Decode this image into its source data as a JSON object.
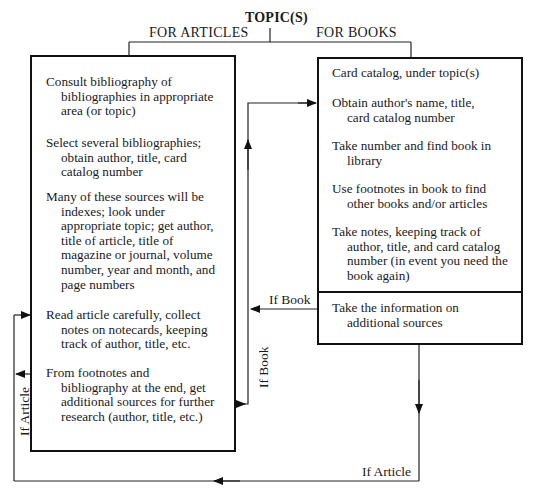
{
  "title": "TOPIC(S)",
  "branches": {
    "articles": "FOR ARTICLES",
    "books": "FOR BOOKS"
  },
  "articles_box": {
    "items": [
      {
        "first": "Consult bibliography of",
        "rest": [
          "bibliographies in appropriate",
          "area (or topic)"
        ]
      },
      {
        "first": "Select several bibliographies;",
        "rest": [
          "obtain author, title, card",
          "catalog number"
        ]
      },
      {
        "first": "Many of these sources will be",
        "rest": [
          "indexes; look under",
          "appropriate topic; get author,",
          "title of article, title of",
          "magazine or journal, volume",
          "number, year and month, and",
          "page numbers"
        ]
      },
      {
        "first": "Read article carefully, collect",
        "rest": [
          "notes on notecards, keeping",
          "track of author, title, etc."
        ]
      },
      {
        "first": "From footnotes and",
        "rest": [
          "bibliography at the end, get",
          "additional sources for further",
          "research (author, title, etc.)"
        ]
      }
    ]
  },
  "books_box": {
    "items": [
      {
        "first": "Card catalog, under topic(s)",
        "rest": []
      },
      {
        "first": "Obtain author's name, title,",
        "rest": [
          "card catalog number"
        ]
      },
      {
        "first": "Take number and find book in",
        "rest": [
          "library"
        ]
      },
      {
        "first": "Use footnotes in book to find",
        "rest": [
          "other books and/or articles"
        ]
      },
      {
        "first": "Take notes, keeping track of",
        "rest": [
          "author, title, and card catalog",
          "number (in event you need the",
          "book again)"
        ]
      }
    ],
    "bottom_section": {
      "first": "Take the information on",
      "rest": [
        "additional sources"
      ]
    }
  },
  "connector_labels": {
    "if_book_horizontal": "If Book",
    "if_book_vertical": "If Book",
    "if_article_vertical": "If Article",
    "if_article_bottom": "If Article"
  }
}
